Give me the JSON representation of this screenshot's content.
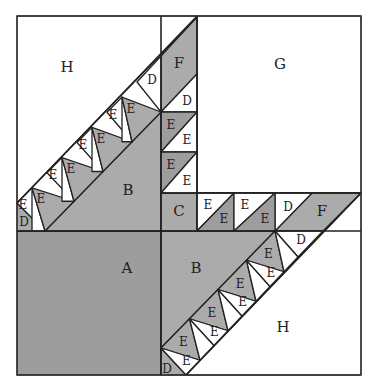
{
  "diagram": {
    "colors": {
      "background": "#ffffff",
      "dark_fabric": "#9d9d9d",
      "medium_fabric": "#ababab",
      "light_fabric": "#ffffff",
      "line": "#222222"
    },
    "block": {
      "x": 17,
      "y": 16,
      "width": 344,
      "height": 359
    },
    "pieces": [
      {
        "id": "A",
        "label": "A",
        "fill": "dark",
        "points": "17,231 161,231 161,375 17,375",
        "label_pos": [
          127,
          268
        ]
      },
      {
        "id": "B-top",
        "label": "B",
        "fill": "medium",
        "points": "45,231 161,112 161,231",
        "label_pos": [
          128,
          190
        ]
      },
      {
        "id": "B-bottom",
        "label": "B",
        "fill": "medium",
        "points": "161,231 275,231 161,348",
        "label_pos": [
          196,
          268
        ]
      },
      {
        "id": "C",
        "label": "C",
        "fill": "medium",
        "points": "161,193 197,193 197,231 161,231",
        "label_pos": [
          179,
          211
        ]
      },
      {
        "id": "G",
        "label": "G",
        "fill": "light",
        "points": "197,16 361,16 361,193 197,193",
        "label_pos": [
          280,
          64
        ]
      },
      {
        "id": "H-top",
        "label": "H",
        "fill": "light",
        "points": "17,16 197,16 17,203",
        "label_pos": [
          67,
          67
        ]
      },
      {
        "id": "H-bottom",
        "label": "H",
        "fill": "light",
        "points": "361,193 361,375 186,375",
        "label_pos": [
          283,
          327
        ]
      },
      {
        "id": "F-top",
        "label": "F",
        "fill": "medium",
        "points": "161,56 197,17 197,74 161,112",
        "label_pos": [
          179,
          63
        ]
      },
      {
        "id": "F-right",
        "label": "F",
        "fill": "medium",
        "points": "312,193 361,193 323,231 275,231",
        "label_pos": [
          322,
          211
        ]
      },
      {
        "id": "D-col",
        "label": "D",
        "fill": "light",
        "points": "161,112 197,74 197,112",
        "label_pos": [
          187,
          101
        ]
      },
      {
        "id": "D-row",
        "label": "D",
        "fill": "light",
        "points": "275,193 312,193 275,231",
        "label_pos": [
          288,
          207
        ]
      },
      {
        "id": "D-top-left",
        "label": "D",
        "fill": "medium",
        "points": "17,203 45,231 17,231",
        "label_pos": [
          24,
          222
        ]
      },
      {
        "id": "D-top-strip",
        "label": "D",
        "fill": "light",
        "points": "161,56 161,112 137,82",
        "label_pos": [
          152,
          80
        ]
      },
      {
        "id": "D-bottom-strip",
        "label": "D",
        "fill": "light",
        "points": "275,231 323,231 298,257",
        "label_pos": [
          301,
          240
        ]
      },
      {
        "id": "D-bottom-left",
        "label": "D",
        "fill": "medium",
        "points": "161,348 186,375 161,375",
        "label_pos": [
          167,
          369
        ]
      }
    ],
    "col_e_cells": [
      {
        "y0": 112,
        "y1": 152,
        "dark_label": "E",
        "light_label": "E"
      },
      {
        "y0": 152,
        "y1": 193,
        "dark_label": "E",
        "light_label": "E"
      }
    ],
    "row_e_cells": [
      {
        "x0": 197,
        "x1": 234,
        "dark_label": "E",
        "light_label": "E"
      },
      {
        "x0": 234,
        "x1": 275,
        "dark_label": "E",
        "light_label": "E"
      }
    ],
    "strip_top_labels": [
      "E",
      "E",
      "E",
      "E",
      "E",
      "E",
      "E",
      "E"
    ],
    "strip_bottom_labels": [
      "E",
      "E",
      "E",
      "E",
      "E",
      "E",
      "E",
      "E"
    ]
  }
}
